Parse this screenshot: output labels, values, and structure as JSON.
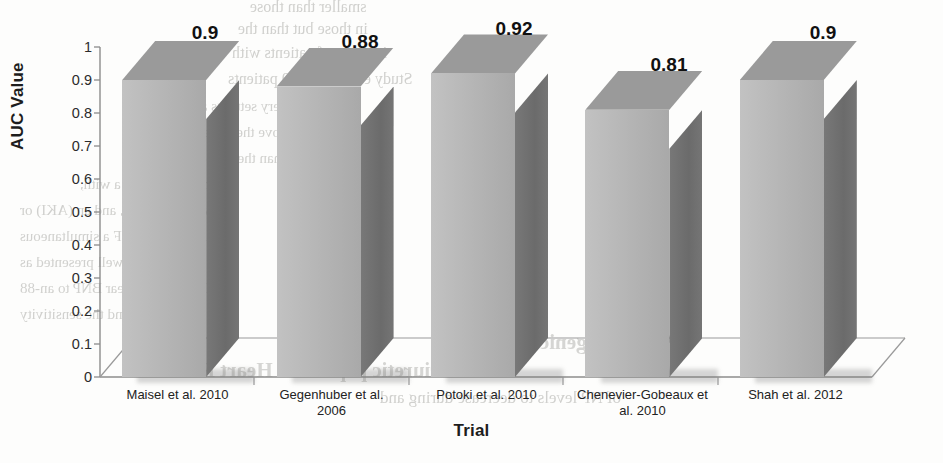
{
  "chart_data": {
    "type": "bar",
    "title": "",
    "subtitle": "",
    "xlabel": "Trial",
    "ylabel": "AUC Value",
    "categories": [
      "Maisel et al. 2010",
      "Gegenhuber et al. 2006",
      "Potoki et al. 2010",
      "Chenevier-Gobeaux et al. 2010",
      "Shah et al. 2012"
    ],
    "values": [
      0.9,
      0.88,
      0.92,
      0.81,
      0.9
    ],
    "data_labels": [
      "0.9",
      "0.88",
      "0.92",
      "0.81",
      "0.9"
    ],
    "ylim": [
      0,
      1
    ],
    "ytick_step": 0.1,
    "ytick_labels": [
      "1",
      "0.9",
      "0.8",
      "0.7",
      "0.6",
      "0.5",
      "0.4",
      "0.3",
      "0.2",
      "0.1",
      "0"
    ],
    "grid": false,
    "legend": "none",
    "style": "3d-column",
    "colors": {
      "bar_front": "#b4b4b4",
      "bar_side": "#6e6e6e",
      "bar_top": "#9a9a9a",
      "axis": "#8c8c8c",
      "text": "#1d1d1d",
      "background": "#fdfdfc"
    }
  },
  "background_bleed": {
    "note": "faint mirrored show-through text from the reverse side of the scanned page",
    "lines": [
      "smaller than those",
      "in those but than the",
      "in a rate of patients with",
      "Study evaluated 669 patients",
      "the data are very settings and is the",
      "BNP cutoff above the upper limit of",
      "greater than the 80% probable",
      "within based near a with,",
      "vascular, emia, and an (AKI) or",
      "also effective HF a simultaneous",
      "study. It is a well presented  as",
      "NT-proBNP near BNP to an-88",
      "an absolute and the sensitivity",
      "Pro-Angiogenic",
      "Natriuretic peptide in Heart Failure",
      "of NP levels to decrease during and"
    ]
  }
}
